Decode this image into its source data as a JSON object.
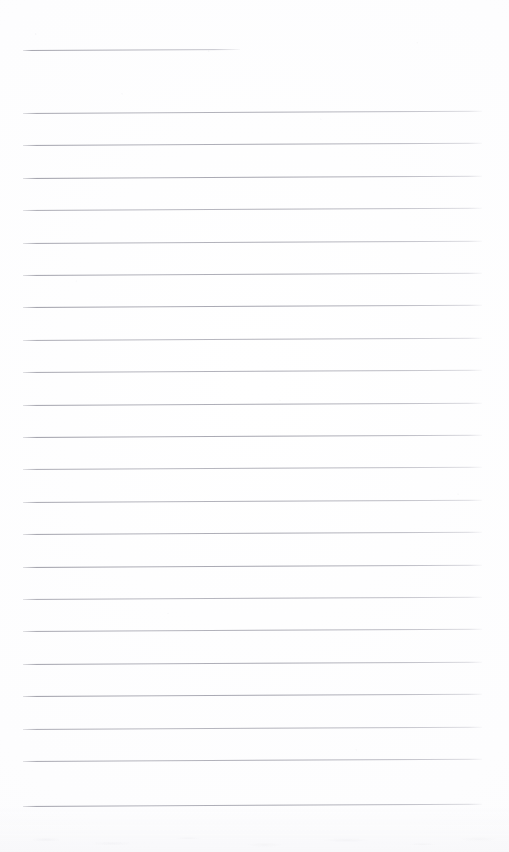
{
  "document": {
    "title": "Scanned Blank Ruled Notepad Page",
    "kind": "scanned-paper",
    "page_width": 509,
    "page_height": 852,
    "paper_color": "#fdfdfe",
    "rule_color": "#90909c",
    "has_visible_text": false,
    "content_text": "",
    "notes": "Blank lined writing paper; no handwriting, headings, labels or numbers are present."
  },
  "layout": {
    "left_margin_x": 23,
    "right_edge_x": 482,
    "header_rule_right_edge_x": 240,
    "first_rule_y": 50,
    "body_first_rule_y": 113,
    "rule_spacing_px": 32.4,
    "rule_slant_deg": -0.28,
    "rule_count_total": 23,
    "body_rule_count": 22
  },
  "rules": [
    {
      "id": "rule-header",
      "y": 50,
      "x": 23,
      "width": 217,
      "type": "header"
    },
    {
      "id": "rule-01",
      "y": 113,
      "x": 23,
      "width": 459,
      "type": "body"
    },
    {
      "id": "rule-02",
      "y": 145.4,
      "x": 23,
      "width": 459,
      "type": "body"
    },
    {
      "id": "rule-03",
      "y": 177.8,
      "x": 23,
      "width": 459,
      "type": "body"
    },
    {
      "id": "rule-04",
      "y": 210.2,
      "x": 23,
      "width": 459,
      "type": "body"
    },
    {
      "id": "rule-05",
      "y": 242.6,
      "x": 23,
      "width": 459,
      "type": "body"
    },
    {
      "id": "rule-06",
      "y": 275.0,
      "x": 23,
      "width": 459,
      "type": "body"
    },
    {
      "id": "rule-07",
      "y": 307.4,
      "x": 23,
      "width": 459,
      "type": "body"
    },
    {
      "id": "rule-08",
      "y": 339.8,
      "x": 23,
      "width": 459,
      "type": "body"
    },
    {
      "id": "rule-09",
      "y": 372.2,
      "x": 23,
      "width": 459,
      "type": "body"
    },
    {
      "id": "rule-10",
      "y": 404.6,
      "x": 23,
      "width": 459,
      "type": "body"
    },
    {
      "id": "rule-11",
      "y": 437.0,
      "x": 23,
      "width": 459,
      "type": "body"
    },
    {
      "id": "rule-12",
      "y": 469.4,
      "x": 23,
      "width": 459,
      "type": "body"
    },
    {
      "id": "rule-13",
      "y": 501.8,
      "x": 23,
      "width": 459,
      "type": "body"
    },
    {
      "id": "rule-14",
      "y": 534.2,
      "x": 23,
      "width": 459,
      "type": "body"
    },
    {
      "id": "rule-15",
      "y": 566.6,
      "x": 23,
      "width": 459,
      "type": "body"
    },
    {
      "id": "rule-16",
      "y": 599.0,
      "x": 23,
      "width": 459,
      "type": "body"
    },
    {
      "id": "rule-17",
      "y": 631.4,
      "x": 23,
      "width": 459,
      "type": "body"
    },
    {
      "id": "rule-18",
      "y": 663.8,
      "x": 23,
      "width": 459,
      "type": "body"
    },
    {
      "id": "rule-19",
      "y": 696.2,
      "x": 23,
      "width": 459,
      "type": "body"
    },
    {
      "id": "rule-20",
      "y": 728.6,
      "x": 23,
      "width": 459,
      "type": "body"
    },
    {
      "id": "rule-21",
      "y": 761.0,
      "x": 23,
      "width": 459,
      "type": "body"
    },
    {
      "id": "rule-22",
      "y": 806.0,
      "x": 23,
      "width": 459,
      "type": "body"
    }
  ]
}
